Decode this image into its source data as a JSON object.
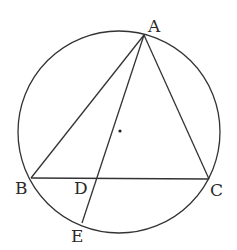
{
  "diagram": {
    "type": "geometry",
    "circle": {
      "cx": 119,
      "cy": 132,
      "r": 101
    },
    "points": {
      "A": {
        "label": "A",
        "x": 144,
        "y": 35
      },
      "B": {
        "label": "B",
        "x": 31,
        "y": 178
      },
      "C": {
        "label": "C",
        "x": 209,
        "y": 179
      },
      "D": {
        "label": "D",
        "x": 97,
        "y": 178
      },
      "E": {
        "label": "E",
        "x": 82,
        "y": 223
      },
      "O": {
        "label": "",
        "x": 120,
        "y": 131
      }
    },
    "segments": [
      [
        "A",
        "B"
      ],
      [
        "A",
        "C"
      ],
      [
        "B",
        "C"
      ],
      [
        "A",
        "E"
      ]
    ],
    "colors": {
      "stroke": "#333333",
      "text": "#2a2a2a"
    }
  }
}
